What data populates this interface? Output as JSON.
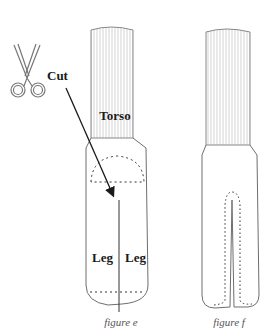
{
  "diagram": {
    "type": "sewing-pattern-illustration",
    "labels": {
      "cut": "Cut",
      "torso": "Torso",
      "leg_left": "Leg",
      "leg_right": "Leg"
    },
    "figures": [
      {
        "id": "e",
        "caption": "figure e",
        "description": "Tube with torso stripes, dashed semicircle at top of leg section, dashed hem line, center cut line"
      },
      {
        "id": "f",
        "caption": "figure f",
        "description": "Tube with torso stripes, legs split by center slit with dotted stitch line around"
      }
    ],
    "icons": [
      "scissors-icon",
      "arrow-icon"
    ],
    "colors": {
      "outline": "#6e6e6e",
      "stripes": "#c8c8c8",
      "text": "#1a1a1a",
      "caption": "#555555",
      "dashed": "#333333"
    }
  }
}
